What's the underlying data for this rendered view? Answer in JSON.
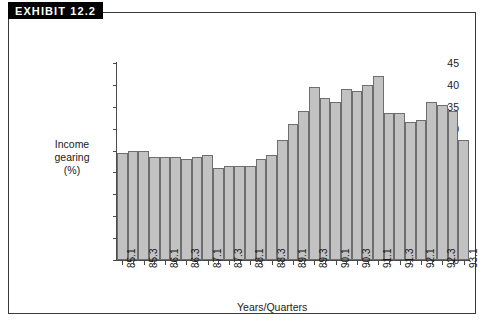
{
  "exhibit": {
    "badge_label": "EXHIBIT 12.2"
  },
  "chart_data": {
    "type": "bar",
    "title": "",
    "xlabel": "Years/Quarters",
    "ylabel": "Income gearing (%)",
    "ylabel_lines": [
      "Income",
      "gearing",
      "(%)"
    ],
    "ylim": [
      0,
      45
    ],
    "ytick_step": 5,
    "yticks": [
      0,
      5,
      10,
      15,
      20,
      25,
      30,
      35,
      40,
      45
    ],
    "ytick_labels": [
      "0",
      "5",
      "10",
      "15",
      "20",
      "25",
      "30",
      "35",
      "40",
      "45"
    ],
    "grid": false,
    "legend": "none",
    "categories": [
      "85.1",
      "85.2",
      "85.3",
      "85.4",
      "86.1",
      "86.2",
      "86.3",
      "86.4",
      "87.1",
      "87.2",
      "87.3",
      "87.4",
      "88.1",
      "88.2",
      "88.3",
      "88.4",
      "89.1",
      "89.2",
      "89.3",
      "89.4",
      "90.1",
      "90.2",
      "90.3",
      "90.4",
      "91.1",
      "91.2",
      "91.3",
      "91.4",
      "92.1",
      "92.2",
      "92.3",
      "92.4",
      "93.1"
    ],
    "xtick_labels_shown": [
      "85.1",
      "85.3",
      "86.1",
      "86.3",
      "87.1",
      "87.3",
      "88.1",
      "88.3",
      "89.1",
      "89.3",
      "90.1",
      "90.3",
      "91.1",
      "91.3",
      "92.1",
      "92.3",
      "93.1"
    ],
    "values": [
      24.5,
      25.0,
      25.0,
      23.5,
      23.5,
      23.5,
      23.0,
      23.5,
      24.0,
      21.0,
      21.5,
      21.5,
      21.5,
      23.0,
      24.0,
      27.5,
      31.0,
      34.0,
      39.5,
      37.0,
      36.0,
      39.0,
      38.5,
      40.0,
      42.0,
      33.5,
      33.5,
      31.5,
      32.0,
      36.0,
      35.5,
      34.0,
      27.5
    ],
    "bar_color": "#c2c2c2",
    "bar_edge_color": "#6e6e6e",
    "axis_color": "#4a4a4a"
  }
}
